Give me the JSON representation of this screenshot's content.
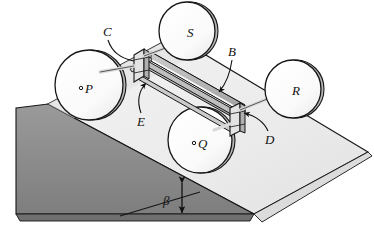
{
  "figure": {
    "kind": "engineering-mechanics-diagram",
    "background_color": "#ffffff"
  },
  "labels": {
    "wheel_p": "P",
    "wheel_q": "Q",
    "wheel_r": "R",
    "wheel_s": "S",
    "bracket_c": "C",
    "beam_b": "B",
    "bracket_d": "D",
    "axle_e": "E",
    "angle_beta": "β"
  },
  "parts": [
    {
      "id": "P",
      "name": "wheel-p",
      "label": "P",
      "role": "wheel",
      "hub_marker": true
    },
    {
      "id": "Q",
      "name": "wheel-q",
      "label": "Q",
      "role": "wheel",
      "hub_marker": true
    },
    {
      "id": "R",
      "name": "wheel-r",
      "label": "R",
      "role": "wheel",
      "hub_marker": false
    },
    {
      "id": "S",
      "name": "wheel-s",
      "label": "S",
      "role": "wheel",
      "hub_marker": false
    },
    {
      "id": "C",
      "name": "bracket-c",
      "label": "C",
      "role": "bearing-bracket"
    },
    {
      "id": "D",
      "name": "bracket-d",
      "label": "D",
      "role": "bearing-bracket"
    },
    {
      "id": "B",
      "name": "beam-b",
      "label": "B",
      "role": "frame-beam"
    },
    {
      "id": "E",
      "name": "axle-e",
      "label": "E",
      "role": "axle"
    }
  ],
  "incline": {
    "angle_label": "β",
    "top_face_color": "#efefef",
    "left_face_color": "#8a8a8a",
    "front_face_color": "#b5b5b5",
    "edge_color": "#1a1a1a"
  },
  "colors": {
    "wheel_fill": "#fbfbfb",
    "wheel_rim_shadow": "#a9a9a9",
    "beam_fill": "#d6d6d6",
    "beam_highlight": "#f4f4f4",
    "beam_shadow": "#9c9c9c",
    "bracket_fill": "#dcdcdc",
    "ramp_shadow": "#cfcfcf",
    "outline": "#161616",
    "text": "#111111"
  }
}
